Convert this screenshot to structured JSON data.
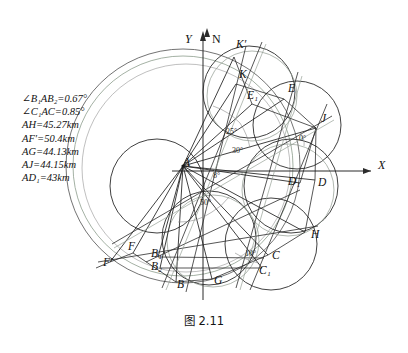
{
  "figure": {
    "caption": "图 2.11",
    "axes": {
      "x_label": "X",
      "y_label": "Y",
      "north_label": "N"
    },
    "legend_lines": [
      "∠B₁AB₂=0.67°",
      "∠C₁AC=0.85°",
      "AH=45.27km",
      "AF′=50.4km",
      "AG=44.13km",
      "AJ=44.15km",
      "AD₁=43km"
    ],
    "point_labels": [
      {
        "id": "A",
        "text": "A",
        "x": 183,
        "y": 166
      },
      {
        "id": "K2",
        "text": "K′",
        "x": 236,
        "y": 48
      },
      {
        "id": "K",
        "text": "K",
        "x": 239,
        "y": 78
      },
      {
        "id": "E1",
        "text": "E₁",
        "x": 247,
        "y": 99
      },
      {
        "id": "E",
        "text": "E",
        "x": 288,
        "y": 92
      },
      {
        "id": "J",
        "text": "J",
        "x": 321,
        "y": 122
      },
      {
        "id": "D1",
        "text": "D₁",
        "x": 288,
        "y": 185
      },
      {
        "id": "D",
        "text": "D",
        "x": 318,
        "y": 186
      },
      {
        "id": "H",
        "text": "H",
        "x": 311,
        "y": 238
      },
      {
        "id": "C",
        "text": "C",
        "x": 272,
        "y": 259
      },
      {
        "id": "C1",
        "text": "C₁",
        "x": 259,
        "y": 274
      },
      {
        "id": "G",
        "text": "G",
        "x": 214,
        "y": 284
      },
      {
        "id": "B",
        "text": "B",
        "x": 177,
        "y": 288
      },
      {
        "id": "B2",
        "text": "B₂",
        "x": 151,
        "y": 270
      },
      {
        "id": "B1",
        "text": "B₁",
        "x": 151,
        "y": 257
      },
      {
        "id": "F",
        "text": "F",
        "x": 128,
        "y": 250
      },
      {
        "id": "Fp",
        "text": "F′",
        "x": 103,
        "y": 266
      }
    ],
    "angle_labels": [
      {
        "id": "a25",
        "text": "25°",
        "x": 226,
        "y": 134
      },
      {
        "id": "a30",
        "text": "30°",
        "x": 232,
        "y": 153
      },
      {
        "id": "a8",
        "text": "8°",
        "x": 213,
        "y": 178
      },
      {
        "id": "a50",
        "text": "50°",
        "x": 200,
        "y": 205
      },
      {
        "id": "a10",
        "text": "10°",
        "x": 245,
        "y": 256
      },
      {
        "id": "a0",
        "text": "0°",
        "x": 299,
        "y": 141
      }
    ],
    "colors": {
      "ink": "#1a1a1a",
      "stroke_dark": "#2b2b2b",
      "stroke_mid": "#4a4a4a",
      "stroke_light": "#8f9a8f",
      "arc_green": "#9aa89a",
      "arc_gray": "#707070",
      "background": "#ffffff"
    }
  }
}
